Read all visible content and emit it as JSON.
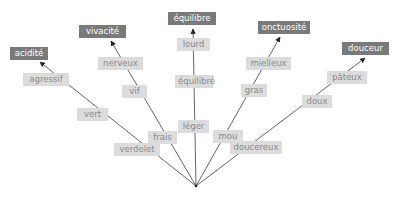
{
  "diagram": {
    "origin": {
      "x": 196,
      "y": 186
    },
    "colors": {
      "main_box": "#7a7a7a",
      "sub_box": "#dcdcdc",
      "sub_text": "#8a8a8a",
      "line": "#555555"
    },
    "branches": [
      {
        "end": {
          "x": 40,
          "y": 62
        },
        "main": {
          "label": "acidité",
          "x": 10,
          "y": 47,
          "w": 38
        },
        "subs": [
          {
            "label": "agressif",
            "x": 23,
            "y": 73,
            "w": 46
          },
          {
            "label": "vert",
            "x": 77,
            "y": 108,
            "w": 31
          },
          {
            "label": "verdelet",
            "x": 114,
            "y": 143,
            "w": 46
          }
        ]
      },
      {
        "end": {
          "x": 111,
          "y": 41
        },
        "main": {
          "label": "vivacité",
          "x": 79,
          "y": 25,
          "w": 47
        },
        "subs": [
          {
            "label": "nerveux",
            "x": 98,
            "y": 57,
            "w": 45
          },
          {
            "label": "vif",
            "x": 122,
            "y": 85,
            "w": 25
          },
          {
            "label": "frais",
            "x": 148,
            "y": 131,
            "w": 29
          }
        ]
      },
      {
        "end": {
          "x": 193,
          "y": 29
        },
        "main": {
          "label": "équilibre",
          "x": 168,
          "y": 12,
          "w": 48
        },
        "subs": [
          {
            "label": "lourd",
            "x": 177,
            "y": 38,
            "w": 33
          },
          {
            "label": "équilibré",
            "x": 175,
            "y": 75,
            "w": 38
          },
          {
            "label": "léger",
            "x": 178,
            "y": 120,
            "w": 31
          }
        ]
      },
      {
        "end": {
          "x": 280,
          "y": 37
        },
        "main": {
          "label": "onctuosité",
          "x": 258,
          "y": 21,
          "w": 52
        },
        "subs": [
          {
            "label": "mielleux",
            "x": 246,
            "y": 57,
            "w": 45
          },
          {
            "label": "gras",
            "x": 241,
            "y": 84,
            "w": 26
          },
          {
            "label": "mou",
            "x": 213,
            "y": 130,
            "w": 30
          }
        ]
      },
      {
        "end": {
          "x": 365,
          "y": 58
        },
        "main": {
          "label": "douceur",
          "x": 342,
          "y": 42,
          "w": 47
        },
        "subs": [
          {
            "label": "pâteux",
            "x": 327,
            "y": 71,
            "w": 40
          },
          {
            "label": "doux",
            "x": 302,
            "y": 95,
            "w": 30
          },
          {
            "label": "doucereux",
            "x": 230,
            "y": 141,
            "w": 52
          }
        ]
      }
    ]
  }
}
